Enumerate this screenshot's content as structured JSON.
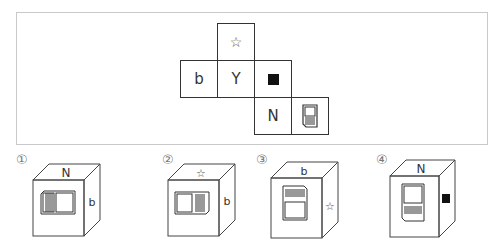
{
  "question": {
    "net": {
      "cells": [
        {
          "id": "top",
          "symbol": "☆",
          "type": "star"
        },
        {
          "id": "left",
          "symbol": "b",
          "type": "letter"
        },
        {
          "id": "center",
          "symbol": "Y",
          "type": "letter"
        },
        {
          "id": "right",
          "symbol": "■",
          "type": "black-square"
        },
        {
          "id": "bottom",
          "symbol": "N",
          "type": "letter"
        },
        {
          "id": "bottom-right",
          "symbol": "document",
          "type": "document-icon"
        }
      ]
    }
  },
  "options": [
    {
      "label": "①",
      "top": "N",
      "front": "document (rotated, lines left)",
      "side": "b"
    },
    {
      "label": "②",
      "top": "☆",
      "front": "document (rotated, lines right)",
      "side": "b"
    },
    {
      "label": "③",
      "top": "b",
      "front": "document (lines top)",
      "side": "☆"
    },
    {
      "label": "④",
      "top": "N",
      "front": "document (lines bottom)",
      "side": "■"
    }
  ]
}
